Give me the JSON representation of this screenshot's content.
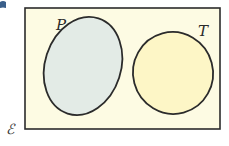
{
  "diagram": {
    "type": "venn",
    "universal_set": {
      "label": "ℰ",
      "fill": "#fdfbe3",
      "stroke": "#2b2b2b"
    },
    "sets": [
      {
        "label": "P",
        "fill": "#e3ebe6",
        "stroke": "#2b2b2b"
      },
      {
        "label": "T",
        "fill": "#fdf6c6",
        "stroke": "#2b2b2b"
      }
    ],
    "relationship": "disjoint"
  },
  "corner_mark": {
    "color": "#3a5f8a"
  }
}
